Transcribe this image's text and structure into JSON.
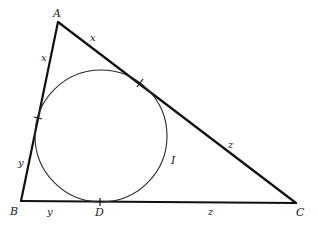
{
  "diagram": {
    "colors": {
      "background": "#ffffff",
      "stroke": "#111111",
      "circle_stroke": "#2a2a2a",
      "text": "#1a1a1a"
    },
    "vertices": {
      "A": {
        "label": "A",
        "x": 58,
        "y": 22
      },
      "B": {
        "label": "B",
        "x": 21,
        "y": 201
      },
      "C": {
        "label": "C",
        "x": 296,
        "y": 203
      }
    },
    "incircle": {
      "label": "I",
      "cx": 101,
      "cy": 136,
      "r": 66
    },
    "tangent_points": {
      "D": {
        "label": "D",
        "x": 100,
        "y": 202,
        "side": "BC"
      },
      "E": {
        "x": 140,
        "y": 83,
        "side": "AC"
      },
      "F": {
        "x": 38,
        "y": 118,
        "side": "AB"
      }
    },
    "segment_labels": {
      "AF": "x",
      "AE": "x",
      "BF": "y",
      "BD": "y",
      "CE": "z",
      "CD": "z"
    }
  }
}
